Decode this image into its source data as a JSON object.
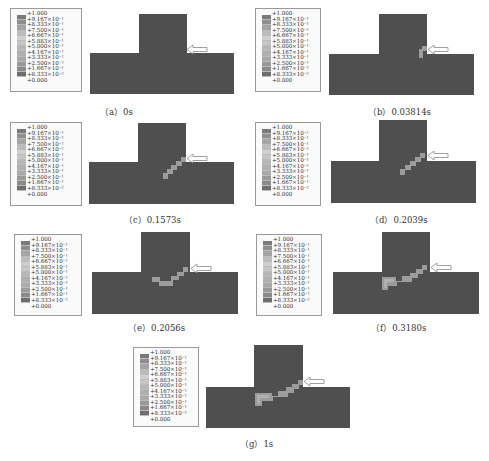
{
  "legend": {
    "labels": [
      "1.000",
      "9.167×10⁻¹",
      "8.333×10⁻¹",
      "7.500×10⁻¹",
      "6.667×10⁻¹",
      "5.883×10⁻¹",
      "5.000×10⁻¹",
      "4.167×10⁻¹",
      "3.333×10⁻¹",
      "2.500×10⁻¹",
      "1.667×10⁻¹",
      "8.333×10⁻²",
      "0.000"
    ],
    "band_colors": [
      "#7a7a7a",
      "#8e8e8e",
      "#a4a4a4",
      "#bcbcbc",
      "#cfcfcf",
      "#c6c6c6",
      "#b7b7b7",
      "#b0b0b0",
      "#a9a9a9",
      "#9a9a9a",
      "#8a8a8a",
      "#6e6e6e"
    ]
  },
  "colors": {
    "body": "#4f4f4f",
    "damage": "#9c9c9c",
    "arrow_fill": "#ffffff",
    "arrow_stroke": "#888888"
  },
  "panels": [
    {
      "id": "a",
      "caption": "（a）0s"
    },
    {
      "id": "b",
      "caption": "（b）0.03814s"
    },
    {
      "id": "c",
      "caption": "（c）0.1573s"
    },
    {
      "id": "d",
      "caption": "（d）0.2039s"
    },
    {
      "id": "e",
      "caption": "（e）0.2056s"
    },
    {
      "id": "f",
      "caption": "（f）0.3180s"
    },
    {
      "id": "g",
      "caption": "（g）1s"
    }
  ]
}
